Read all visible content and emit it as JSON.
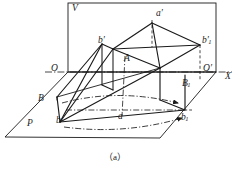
{
  "figure": {
    "caption": "（a）",
    "background_color": "#ffffff",
    "line_color": "#1a1a1a",
    "labels": [
      {
        "id": "V",
        "text": "V",
        "sub": "",
        "prime": false,
        "x": 72,
        "y": 4
      },
      {
        "id": "a-prime",
        "text": "a",
        "sub": "",
        "prime": true,
        "x": 156,
        "y": 9
      },
      {
        "id": "b-prime",
        "text": "b",
        "sub": "",
        "prime": true,
        "x": 98,
        "y": 36
      },
      {
        "id": "b1-prime",
        "text": "b",
        "sub": "1",
        "prime": true,
        "x": 202,
        "y": 36
      },
      {
        "id": "A",
        "text": "A",
        "sub": "",
        "prime": false,
        "x": 124,
        "y": 54
      },
      {
        "id": "O",
        "text": "O",
        "sub": "",
        "prime": false,
        "x": 51,
        "y": 64
      },
      {
        "id": "O-prime",
        "text": "O",
        "sub": "",
        "prime": true,
        "x": 203,
        "y": 64
      },
      {
        "id": "X",
        "text": "X",
        "sub": "",
        "prime": false,
        "x": 225,
        "y": 72
      },
      {
        "id": "B1",
        "text": "B",
        "sub": "1",
        "prime": false,
        "x": 182,
        "y": 79
      },
      {
        "id": "B",
        "text": "B",
        "sub": "",
        "prime": false,
        "x": 38,
        "y": 94
      },
      {
        "id": "a",
        "text": "a",
        "sub": "",
        "prime": false,
        "x": 118,
        "y": 112
      },
      {
        "id": "b1",
        "text": "b",
        "sub": "1",
        "prime": false,
        "x": 181,
        "y": 113
      },
      {
        "id": "b",
        "text": "b",
        "sub": "",
        "prime": false,
        "x": 56,
        "y": 116
      },
      {
        "id": "P",
        "text": "P",
        "sub": "",
        "prime": false,
        "x": 27,
        "y": 119
      }
    ],
    "geometry": {
      "v_plane_rect": "68,3 216,3 216,72 68,72",
      "p_plane_quad": "5,137 68,72 216,72 160,138",
      "axis_line": "45,72 232,72",
      "solid_top_face": "113,49 152,23 200,45 160,68",
      "solid_front_face": "60,122 113,49 160,68 185,110",
      "prism_left_face": "60,122 113,49 102,44 49,113",
      "apex_dashed": "152,23 152,43",
      "vertical_dash_b1": "200,45 200,80",
      "center_dash_vertical": "127,57 122,113",
      "ground_dashdot": "68,110 190,110",
      "arc_upper": "62,104 118,92 180,104",
      "arc_lower": "64,126 122,132 186,120"
    }
  }
}
